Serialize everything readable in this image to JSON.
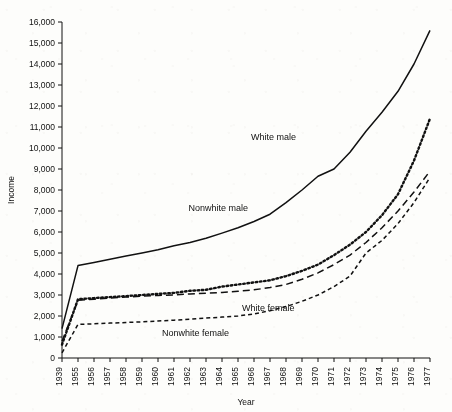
{
  "chart_data": {
    "type": "line",
    "title": "",
    "xlabel": "Year",
    "ylabel": "Income",
    "categories": [
      "1939",
      "1955",
      "1956",
      "1957",
      "1958",
      "1959",
      "1960",
      "1961",
      "1962",
      "1963",
      "1964",
      "1965",
      "1966",
      "1967",
      "1968",
      "1969",
      "1970",
      "1971",
      "1972",
      "1973",
      "1974",
      "1975",
      "1976",
      "1977"
    ],
    "ylim": [
      0,
      16000
    ],
    "ytick_labels": [
      "0",
      "1,000",
      "2,000",
      "3,000",
      "4,000",
      "5,000",
      "6,000",
      "7,000",
      "8,000",
      "9,000",
      "10,000",
      "11,000",
      "12,000",
      "13,000",
      "14,000",
      "15,000",
      "16,000"
    ],
    "ytick_values": [
      0,
      1000,
      2000,
      3000,
      4000,
      5000,
      6000,
      7000,
      8000,
      9000,
      10000,
      11000,
      12000,
      13000,
      14000,
      15000,
      16000
    ],
    "grid": false,
    "legend_position": "inline-annotations",
    "series": [
      {
        "name": "White male",
        "style": "solid",
        "label_x_category": "1969",
        "label_value": 10100,
        "values": [
          1400,
          4400,
          4550,
          4700,
          4850,
          5000,
          5150,
          5350,
          5500,
          5700,
          5950,
          6200,
          6500,
          6850,
          7400,
          8000,
          8650,
          9000,
          9800,
          10800,
          11700,
          12700,
          14000,
          15600
        ]
      },
      {
        "name": "Nonwhite male",
        "style": "dotted",
        "label_x_category": "1966",
        "label_value": 6750,
        "values": [
          640,
          2800,
          2850,
          2900,
          2950,
          3000,
          3050,
          3100,
          3200,
          3250,
          3400,
          3500,
          3600,
          3700,
          3900,
          4150,
          4450,
          4900,
          5400,
          6000,
          6800,
          7800,
          9400,
          11400
        ]
      },
      {
        "name": "White female",
        "style": "long-dash",
        "label_x_category": "1965",
        "label_value": 2650,
        "values": [
          800,
          2750,
          2800,
          2850,
          2900,
          2950,
          2980,
          3000,
          3050,
          3080,
          3120,
          3180,
          3250,
          3350,
          3500,
          3750,
          4050,
          4450,
          4900,
          5500,
          6200,
          7000,
          7900,
          8900
        ]
      },
      {
        "name": "Nonwhite female",
        "style": "short-dash",
        "label_x_category": "1960",
        "label_value": 1550,
        "values": [
          250,
          1600,
          1630,
          1660,
          1690,
          1720,
          1760,
          1800,
          1850,
          1900,
          1950,
          2000,
          2100,
          2250,
          2450,
          2700,
          3000,
          3400,
          3900,
          5000,
          5600,
          6400,
          7400,
          8600
        ]
      }
    ]
  }
}
